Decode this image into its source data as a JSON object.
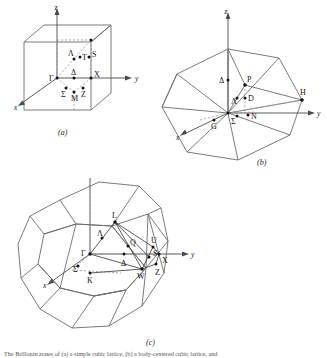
{
  "figure": {
    "title_caption": "The Brillouin zones of (a) a simple cubic lattice, (b) a body-centered cubic lattice, and",
    "panels": [
      {
        "id": "a",
        "caption": "(a)",
        "lattice": "simple cubic",
        "shape": "cube",
        "axes": [
          {
            "name": "x",
            "label": "x"
          },
          {
            "name": "y",
            "label": "y"
          },
          {
            "name": "z",
            "label": "z"
          }
        ],
        "symmetry_points": [
          {
            "label": "Γ",
            "name": "gamma"
          },
          {
            "label": "Λ",
            "name": "lambda"
          },
          {
            "label": "T",
            "name": "t"
          },
          {
            "label": "S",
            "name": "s"
          },
          {
            "label": "X",
            "name": "x-point"
          },
          {
            "label": "Δ",
            "name": "delta"
          },
          {
            "label": "Σ",
            "name": "sigma"
          },
          {
            "label": "M",
            "name": "m"
          },
          {
            "label": "Z",
            "name": "z-point"
          }
        ]
      },
      {
        "id": "b",
        "caption": "(b)",
        "lattice": "body-centered cubic",
        "shape": "rhombic dodecahedron",
        "axes": [
          {
            "name": "x",
            "label": "x"
          },
          {
            "name": "y",
            "label": "y"
          },
          {
            "name": "z",
            "label": "z"
          }
        ],
        "symmetry_points": [
          {
            "label": "Δ",
            "name": "delta"
          },
          {
            "label": "P",
            "name": "p"
          },
          {
            "label": "Λ",
            "name": "lambda"
          },
          {
            "label": "D",
            "name": "d"
          },
          {
            "label": "H",
            "name": "h"
          },
          {
            "label": "G",
            "name": "g"
          },
          {
            "label": "Σ",
            "name": "sigma"
          },
          {
            "label": "N",
            "name": "n"
          }
        ]
      },
      {
        "id": "c",
        "caption": "(c)",
        "lattice": "face-centered cubic",
        "shape": "truncated octahedron",
        "axes": [
          {
            "name": "x",
            "label": "x"
          },
          {
            "name": "y",
            "label": "y"
          },
          {
            "name": "z",
            "label": "z"
          }
        ],
        "symmetry_points": [
          {
            "label": "L",
            "name": "l"
          },
          {
            "label": "Λ",
            "name": "lambda"
          },
          {
            "label": "Γ",
            "name": "gamma"
          },
          {
            "label": "Q",
            "name": "q"
          },
          {
            "label": "U",
            "name": "u"
          },
          {
            "label": "S",
            "name": "s"
          },
          {
            "label": "X",
            "name": "x-point"
          },
          {
            "label": "Σ",
            "name": "sigma"
          },
          {
            "label": "Δ",
            "name": "delta"
          },
          {
            "label": "K",
            "name": "k"
          },
          {
            "label": "W",
            "name": "w"
          },
          {
            "label": "Z",
            "name": "z-point"
          }
        ]
      }
    ],
    "colors": {
      "line": "#6b6b6b",
      "dashed": "#8a8a8a",
      "text": "#111111",
      "background": "#ffffff"
    }
  }
}
